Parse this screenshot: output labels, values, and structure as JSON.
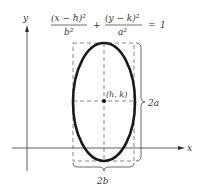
{
  "equation": {
    "num1": "(x − h)²",
    "den1": "b²",
    "plus": "+",
    "num2": "(y − k)²",
    "den2": "a²",
    "equals": "=",
    "rhs": "1"
  },
  "axes": {
    "x_label": "x",
    "y_label": "y"
  },
  "labels": {
    "center": "(h, k)",
    "major": "2a",
    "minor": "2b"
  },
  "colors": {
    "ink": "#222222",
    "dash": "#555555"
  }
}
